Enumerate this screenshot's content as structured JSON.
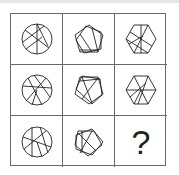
{
  "puzzle": {
    "rows": [
      [
        {
          "shape": "circle-with-lines"
        },
        {
          "shape": "pentagon-star-with-lines"
        },
        {
          "shape": "hexagon-with-lines"
        }
      ],
      [
        {
          "shape": "circle-with-lines"
        },
        {
          "shape": "pentagon-star-with-lines"
        },
        {
          "shape": "hexagon-with-lines"
        }
      ],
      [
        {
          "shape": "circle-with-lines"
        },
        {
          "shape": "pentagon-star-with-lines"
        },
        {
          "shape": "question-mark"
        }
      ]
    ],
    "question_mark": "?"
  },
  "colors": {
    "line": "#222222",
    "grid": "#6a6a6a",
    "background": "#ffffff"
  }
}
